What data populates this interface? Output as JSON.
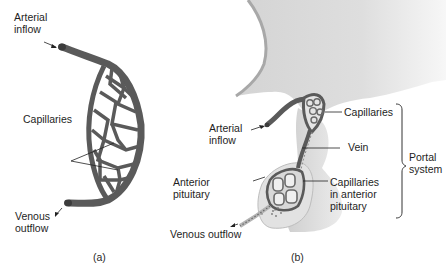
{
  "panel_a": {
    "labels": {
      "arterial_inflow": [
        "Arterial",
        "inflow"
      ],
      "capillaries": "Capillaries",
      "venous_outflow": [
        "Venous",
        "outflow"
      ]
    },
    "caption": "(a)"
  },
  "panel_b": {
    "labels": {
      "capillaries": "Capillaries",
      "arterial_inflow": [
        "Arterial",
        "inflow"
      ],
      "vein": "Vein",
      "anterior_pituitary": [
        "Anterior",
        "pituitary"
      ],
      "capillaries_in_anterior_pituitary": [
        "Capillaries",
        "in anterior",
        "pituitary"
      ],
      "venous_outflow": "Venous outflow",
      "portal_system": [
        "Portal",
        "system"
      ]
    },
    "caption": "(b)"
  },
  "colors": {
    "vessel": "#5a5a5a",
    "vessel_dark": "#3c3c3c",
    "tissue_light": "#e6e6e6",
    "tissue_mid": "#d2d2d2",
    "text": "#1e1e1e"
  }
}
